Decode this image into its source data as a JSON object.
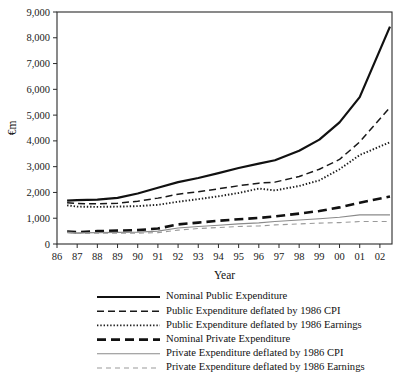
{
  "chart_data": {
    "type": "line",
    "title": "",
    "xlabel": "Year",
    "ylabel": "€m",
    "xlim": [
      1986,
      2002.6
    ],
    "ylim": [
      0,
      9000
    ],
    "grid": false,
    "legend_position": "below",
    "x": [
      1986.5,
      1987,
      1988,
      1989,
      1990,
      1991,
      1992,
      1993,
      1994,
      1995,
      1996,
      1996.8,
      1998,
      1999,
      2000,
      2001,
      2002.5
    ],
    "xtick_labels": [
      "86",
      "87",
      "88",
      "89",
      "90",
      "91",
      "92",
      "93",
      "94",
      "95",
      "96",
      "97",
      "98",
      "99",
      "00",
      "01",
      "02"
    ],
    "xtick_values": [
      1986,
      1987,
      1988,
      1989,
      1990,
      1991,
      1992,
      1993,
      1994,
      1995,
      1996,
      1997,
      1998,
      1999,
      2000,
      2001,
      2002
    ],
    "ytick_labels": [
      "0",
      "1,000",
      "2,000",
      "3,000",
      "4,000",
      "5,000",
      "6,000",
      "7,000",
      "8,000",
      "9,000"
    ],
    "ytick_values": [
      0,
      1000,
      2000,
      3000,
      4000,
      5000,
      6000,
      7000,
      8000,
      9000
    ],
    "series": [
      {
        "name": "Nominal Public Expenditure",
        "style": "solid-thick",
        "color": "#111111",
        "width": 2.2,
        "dash": "",
        "values": [
          1680,
          1700,
          1720,
          1790,
          1960,
          2180,
          2400,
          2560,
          2750,
          2950,
          3120,
          3250,
          3620,
          4050,
          4720,
          5700,
          8430
        ]
      },
      {
        "name": "Public Expenditure deflated by 1986 CPI",
        "style": "dashed",
        "color": "#181818",
        "width": 1.5,
        "dash": "7,4",
        "values": [
          1600,
          1570,
          1560,
          1580,
          1660,
          1780,
          1930,
          2030,
          2140,
          2260,
          2360,
          2400,
          2620,
          2900,
          3280,
          3960,
          5300
        ]
      },
      {
        "name": "Public Expenditure deflated by 1986 Earnings",
        "style": "dotted",
        "color": "#1d1d1d",
        "width": 1.9,
        "dash": "1.4,1.9",
        "values": [
          1500,
          1450,
          1440,
          1450,
          1470,
          1520,
          1640,
          1740,
          1850,
          1980,
          2150,
          2080,
          2250,
          2470,
          2900,
          3450,
          3950
        ]
      },
      {
        "name": "Nominal Private Expenditure",
        "style": "long-dash-bold",
        "color": "#111111",
        "width": 2.6,
        "dash": "9,5",
        "values": [
          480,
          460,
          500,
          520,
          540,
          600,
          760,
          830,
          900,
          960,
          1010,
          1070,
          1180,
          1280,
          1420,
          1600,
          1840
        ]
      },
      {
        "name": "Private Expenditure deflated by 1986 CPI",
        "style": "solid-thin",
        "color": "#8a8a8a",
        "width": 1.1,
        "dash": "",
        "values": [
          460,
          430,
          440,
          450,
          460,
          500,
          620,
          680,
          730,
          780,
          820,
          870,
          930,
          980,
          1040,
          1130,
          1130
        ]
      },
      {
        "name": "Private Expenditure deflated by 1986 Earnings",
        "style": "dashed-thin",
        "color": "#9a9a9a",
        "width": 1.1,
        "dash": "5,4",
        "values": [
          440,
          410,
          415,
          420,
          420,
          440,
          540,
          600,
          640,
          680,
          700,
          740,
          780,
          810,
          830,
          870,
          870
        ]
      }
    ]
  },
  "legend": {
    "items": [
      {
        "label": "Nominal Public Expenditure"
      },
      {
        "label": "Public Expenditure deflated by 1986 CPI"
      },
      {
        "label": "Public Expenditure deflated by 1986 Earnings"
      },
      {
        "label": "Nominal Private Expenditure"
      },
      {
        "label": "Private Expenditure deflated by 1986 CPI"
      },
      {
        "label": "Private Expenditure deflated by 1986 Earnings"
      }
    ]
  }
}
